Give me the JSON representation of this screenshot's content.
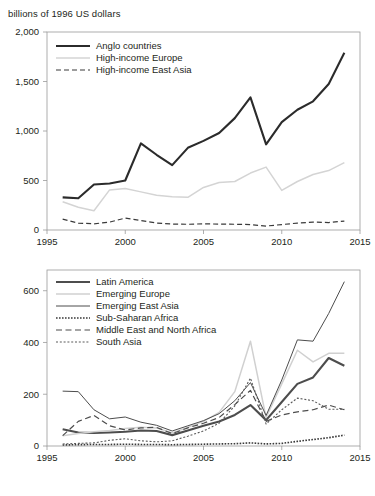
{
  "axis_title": "billions of 1996 US dollars",
  "chart_data": [
    {
      "id": "top",
      "type": "line",
      "title": "billions of 1996 US dollars",
      "xlabel": "",
      "ylabel": "billions of 1996 US dollars",
      "xlim": [
        1995,
        2015
      ],
      "ylim": [
        0,
        2000
      ],
      "xticks": [
        1995,
        2000,
        2005,
        2010,
        2015
      ],
      "xtick_labels": [
        "1995",
        "2000",
        "2005",
        "2010",
        "2015"
      ],
      "yticks": [
        0,
        500,
        1000,
        1500,
        2000
      ],
      "ytick_labels": [
        "0",
        "500",
        "1,000",
        "1,500",
        "2,000"
      ],
      "grid": false,
      "legend_position": "top-left",
      "x": [
        1996,
        1997,
        1998,
        1999,
        2000,
        2001,
        2002,
        2003,
        2004,
        2005,
        2006,
        2007,
        2008,
        2009,
        2010,
        2011,
        2012,
        2013,
        2014
      ],
      "series": [
        {
          "name": "Anglo countries",
          "style": "solid-thick",
          "color": "#2b2b2b",
          "values": [
            330,
            320,
            460,
            470,
            500,
            875,
            760,
            655,
            830,
            900,
            980,
            1130,
            1340,
            865,
            1090,
            1215,
            1300,
            1475,
            1790
          ]
        },
        {
          "name": "High-income Europe",
          "style": "solid-light",
          "color": "#d4d4d4",
          "values": [
            285,
            230,
            195,
            405,
            420,
            385,
            350,
            335,
            330,
            430,
            480,
            490,
            575,
            635,
            400,
            490,
            560,
            600,
            680,
            1005
          ]
        },
        {
          "name": "High-income East Asia",
          "style": "dashed",
          "color": "#3a3a3a",
          "values": [
            110,
            70,
            62,
            80,
            120,
            95,
            70,
            60,
            58,
            62,
            60,
            58,
            55,
            40,
            55,
            70,
            80,
            75,
            90
          ]
        }
      ]
    },
    {
      "id": "bottom",
      "type": "line",
      "title": "",
      "xlabel": "",
      "ylabel": "",
      "xlim": [
        1995,
        2015
      ],
      "ylim": [
        0,
        680
      ],
      "xticks": [
        1995,
        2000,
        2005,
        2010,
        2015
      ],
      "xtick_labels": [
        "1995",
        "2000",
        "2005",
        "2010",
        "2015"
      ],
      "yticks": [
        0,
        200,
        400,
        600
      ],
      "ytick_labels": [
        "0",
        "200",
        "400",
        "600"
      ],
      "grid": false,
      "legend_position": "top-left",
      "x": [
        1996,
        1997,
        1998,
        1999,
        2000,
        2001,
        2002,
        2003,
        2004,
        2005,
        2006,
        2007,
        2008,
        2009,
        2010,
        2011,
        2012,
        2013,
        2014
      ],
      "series": [
        {
          "name": "Latin America",
          "style": "solid-thick",
          "color": "#4d4d4d",
          "values": [
            65,
            52,
            50,
            52,
            55,
            60,
            58,
            42,
            60,
            78,
            95,
            120,
            158,
            100,
            170,
            240,
            265,
            340,
            310
          ]
        },
        {
          "name": "Emerging Europe",
          "style": "solid-light",
          "color": "#d0d0d0",
          "values": [
            40,
            48,
            55,
            60,
            68,
            72,
            70,
            50,
            72,
            95,
            130,
            210,
            405,
            110,
            240,
            370,
            325,
            358,
            358
          ]
        },
        {
          "name": "Emerging East Asia",
          "style": "solid-thin",
          "color": "#4d4d4d",
          "values": [
            212,
            210,
            140,
            105,
            112,
            92,
            80,
            58,
            78,
            98,
            125,
            175,
            245,
            118,
            255,
            410,
            405,
            512,
            635
          ]
        },
        {
          "name": "Sub-Saharan Africa",
          "style": "dotted-thick",
          "color": "#3a3a3a",
          "values": [
            4,
            5,
            6,
            6,
            7,
            6,
            6,
            5,
            6,
            7,
            8,
            9,
            12,
            8,
            10,
            18,
            25,
            32,
            42
          ]
        },
        {
          "name": "Middle East and North Africa",
          "style": "dash-long",
          "color": "#4d4d4d",
          "values": [
            40,
            95,
            118,
            78,
            62,
            70,
            72,
            48,
            70,
            88,
            110,
            160,
            215,
            95,
            120,
            132,
            140,
            158,
            140
          ]
        },
        {
          "name": "South Asia",
          "style": "dotted-fine",
          "color": "#5a5a5a",
          "values": [
            8,
            10,
            12,
            22,
            28,
            20,
            16,
            20,
            38,
            58,
            88,
            155,
            262,
            85,
            140,
            185,
            175,
            142,
            142
          ]
        }
      ]
    }
  ]
}
